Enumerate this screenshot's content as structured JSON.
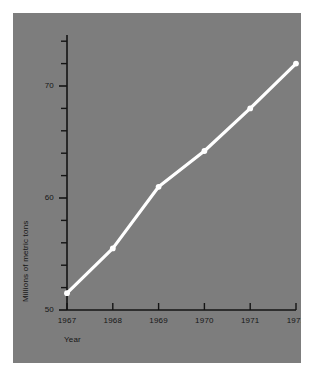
{
  "chart_data": {
    "type": "line",
    "title": "",
    "subtitle": "",
    "xlabel": "Year",
    "ylabel": "Millions of metric tons",
    "x": [
      1967,
      1968,
      1969,
      1970,
      1971,
      1972
    ],
    "categories": [
      "1967",
      "1968",
      "1969",
      "1970",
      "1971",
      "1972"
    ],
    "values": [
      51.5,
      55.5,
      61.0,
      64.2,
      68.0,
      72.0
    ],
    "series": [
      {
        "name": "Millions of metric tons",
        "values": [
          51.5,
          55.5,
          61.0,
          64.2,
          68.0,
          72.0
        ]
      }
    ],
    "xlim": [
      1967,
      1972
    ],
    "ylim": [
      50,
      74
    ],
    "xtick_labels": [
      "1967",
      "1968",
      "1969",
      "1970",
      "1971",
      "1972"
    ],
    "ytick_labels": [
      "50",
      "60",
      "70"
    ],
    "ytick_values": [
      50,
      60,
      70
    ],
    "yminor_tick_values": [
      52,
      54,
      56,
      58,
      62,
      64,
      66,
      68,
      72,
      74
    ],
    "grid": false,
    "legend": false,
    "legend_position": "none",
    "annotations": [],
    "line_color": "#ffffff",
    "marker_color": "#ffffff",
    "background_color": "#7d7d7d",
    "axis_color": "#141414",
    "text_color": "#161616",
    "page_background": "#ffffff"
  },
  "axes": {
    "y_title": "Millions of metric tons",
    "x_title": "Year",
    "y_labels": [
      "70",
      "60",
      "50"
    ],
    "x_labels": [
      "1967",
      "1968",
      "1969",
      "1970",
      "1971",
      "1972"
    ]
  }
}
